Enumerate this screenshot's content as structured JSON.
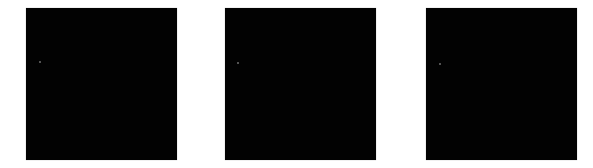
{
  "panels": [
    {
      "id": "panel-1",
      "left": 26,
      "color": "#020202",
      "speck": {
        "x": 13,
        "y": 53
      }
    },
    {
      "id": "panel-2",
      "left": 225,
      "color": "#020202",
      "speck": {
        "x": 12,
        "y": 54
      }
    },
    {
      "id": "panel-3",
      "left": 426,
      "color": "#020202",
      "speck": {
        "x": 13,
        "y": 55
      }
    }
  ]
}
